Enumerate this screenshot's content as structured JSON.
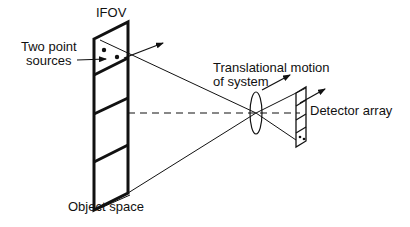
{
  "diagram": {
    "labels": {
      "ifov": "IFOV",
      "two_point_sources_line1": "Two point",
      "two_point_sources_line2": "sources",
      "translational_motion_line1": "Translational motion",
      "translational_motion_line2": "of system",
      "detector_array": "Detector array",
      "object_space": "Object space"
    },
    "colors": {
      "stroke": "#111111",
      "background": "#ffffff"
    },
    "elements": {
      "object_strip_cells": 4,
      "detector_cells": 4,
      "point_sources": 2
    }
  }
}
